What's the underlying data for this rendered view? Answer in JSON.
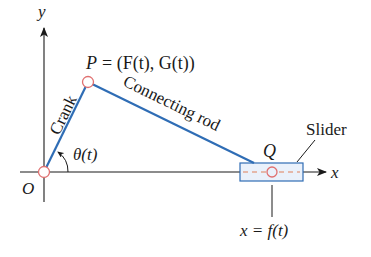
{
  "diagram": {
    "type": "crank-slider mechanism",
    "axes": {
      "x_label": "x",
      "y_label": "y",
      "origin_label": "O"
    },
    "points": {
      "P": {
        "label": "P",
        "equation": "= (F(t), G(t))"
      },
      "Q": {
        "label": "Q"
      }
    },
    "components": {
      "crank_label": "Crank",
      "rod_label": "Connecting rod",
      "slider_label": "Slider"
    },
    "angle_label": "θ(t)",
    "slider_position_eq": "x = f(t)",
    "colors": {
      "link": "#2f6db5",
      "joint": "#e07070",
      "joint_fill": "#ffffff",
      "slider_fill": "#eaf1fb",
      "slider_border": "#2f6db5",
      "dashed_track": "#e0805a",
      "axis": "#1a1a1a"
    }
  }
}
